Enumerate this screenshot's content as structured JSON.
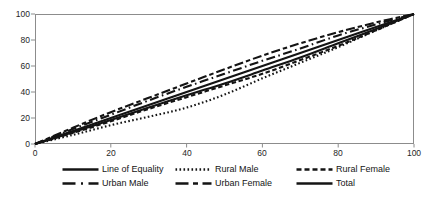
{
  "figure": {
    "background_color": "#ffffff",
    "axis_color": "#8c8c8c",
    "line_color": "#141414"
  },
  "chart_data": {
    "type": "line",
    "title": "",
    "xlabel": "",
    "ylabel": "",
    "xlim": [
      0,
      100
    ],
    "ylim": [
      0,
      100
    ],
    "x_ticks": [
      0,
      20,
      40,
      60,
      80,
      100
    ],
    "y_ticks": [
      0,
      20,
      40,
      60,
      80,
      100
    ],
    "grid": false,
    "legend_position": "bottom",
    "x": [
      0,
      10,
      20,
      30,
      40,
      50,
      60,
      70,
      80,
      90,
      100
    ],
    "series": [
      {
        "name": "Line of Equality",
        "style": "solid",
        "values": [
          0,
          10,
          20,
          30,
          40,
          50,
          60,
          70,
          80,
          90,
          100
        ]
      },
      {
        "name": "Rural Male",
        "style": "dotted",
        "values": [
          0,
          7,
          14.5,
          21,
          28,
          38,
          50.5,
          62.5,
          74.5,
          87.5,
          100
        ]
      },
      {
        "name": "Rural Female",
        "style": "dashed",
        "values": [
          0,
          8.5,
          17.5,
          27,
          36,
          45,
          54,
          64.5,
          75.5,
          87.5,
          100
        ]
      },
      {
        "name": "Urban Male",
        "style": "dash-dot",
        "values": [
          0,
          11.5,
          22.5,
          33.5,
          44,
          54,
          64,
          73.5,
          83.5,
          92,
          100
        ]
      },
      {
        "name": "Urban Female",
        "style": "dash-short-dash",
        "values": [
          0,
          12.5,
          24.5,
          35.5,
          46.5,
          57.5,
          68,
          77.5,
          86,
          93.5,
          100
        ]
      },
      {
        "name": "Total",
        "style": "solid",
        "values": [
          0,
          9,
          18.5,
          28,
          37.5,
          46.5,
          56.5,
          66.5,
          77.5,
          88.5,
          100
        ]
      }
    ]
  }
}
